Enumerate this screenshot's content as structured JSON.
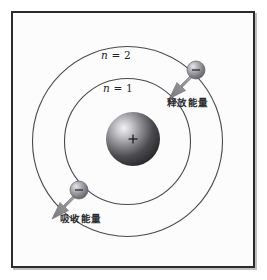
{
  "figure": {
    "background_color": "#fcfcfc",
    "frame_color": "#2b2b2e"
  },
  "labels": {
    "shell_outer": {
      "var": "n",
      "eq": " = ",
      "value": "2"
    },
    "shell_inner": {
      "var": "n",
      "eq": " = ",
      "value": "1"
    },
    "release_energy": "释放能量",
    "absorb_energy": "吸收能量"
  },
  "nucleus": {
    "charge_symbol": "+",
    "color_dark": "#2e2e31",
    "color_light": "#d9d9dc"
  },
  "electrons": [
    {
      "name": "electron-outer",
      "charge_symbol": "−",
      "cx": 196,
      "cy": 70
    },
    {
      "name": "electron-inner",
      "charge_symbol": "−",
      "cx": 79,
      "cy": 190
    }
  ],
  "orbits": [
    {
      "name": "shell-2",
      "cx": 127.5,
      "cy": 141.5,
      "r": 95,
      "stroke": "#4a4a4e"
    },
    {
      "name": "shell-1",
      "cx": 127.5,
      "cy": 141.5,
      "r": 63,
      "stroke": "#4a4a4e"
    }
  ],
  "arrows": [
    {
      "name": "release-arrow",
      "direction": "down-left",
      "color": "#8d8d92"
    },
    {
      "name": "absorb-arrow",
      "direction": "down-left",
      "color": "#8d8d92"
    }
  ]
}
